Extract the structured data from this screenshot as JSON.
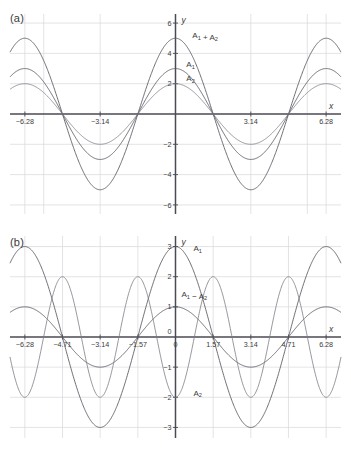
{
  "figure": {
    "panels": [
      {
        "id": "a",
        "label": "(a)",
        "axis": {
          "xlabel": "x",
          "ylabel": "y",
          "xticks": [
            "-6.28",
            "-3.14",
            "3.14",
            "6.28"
          ],
          "xtick_values": [
            -6.28,
            -3.14,
            3.14,
            6.28
          ],
          "yticks": [
            "6",
            "4",
            "2",
            "-2",
            "-4",
            "-6"
          ],
          "ytick_values": [
            6,
            4,
            2,
            -2,
            -4,
            -6
          ],
          "xlim": [
            -6.9,
            6.9
          ],
          "ylim": [
            -6.6,
            6.6
          ]
        },
        "curve_labels": [
          {
            "text": "A",
            "sub": "1",
            "text2": " + A",
            "sub2": "2"
          },
          {
            "text": "A",
            "sub": "1"
          },
          {
            "text": "A",
            "sub": "2"
          }
        ]
      },
      {
        "id": "b",
        "label": "(b)",
        "axis": {
          "xlabel": "x",
          "ylabel": "y",
          "xticks": [
            "-6.28",
            "-4.71",
            "-3.14",
            "-1.57",
            "0",
            "1.57",
            "3.14",
            "4.71",
            "6.28"
          ],
          "xtick_values": [
            -6.28,
            -4.71,
            -3.14,
            -1.57,
            0,
            1.57,
            3.14,
            4.71,
            6.28
          ],
          "yticks": [
            "3",
            "2",
            "1",
            "0",
            "-1",
            "-2",
            "-3"
          ],
          "ytick_values": [
            3,
            2,
            1,
            0,
            -1,
            -2,
            -3
          ],
          "xlim": [
            -6.9,
            6.9
          ],
          "ylim": [
            -3.35,
            3.35
          ]
        },
        "curve_labels": [
          {
            "text": "A",
            "sub": "1"
          },
          {
            "text": "A",
            "sub": "1",
            "text2": " − A",
            "sub2": "2"
          },
          {
            "text": "A",
            "sub": "2"
          }
        ]
      }
    ]
  },
  "chart_data": [
    {
      "type": "line",
      "panel": "(a)",
      "title": "",
      "xlabel": "x",
      "ylabel": "y",
      "xlim": [
        -6.9,
        6.9
      ],
      "ylim": [
        -6.6,
        6.6
      ],
      "xticks": [
        -6.28,
        -3.14,
        3.14,
        6.28
      ],
      "yticks": [
        6,
        4,
        2,
        -2,
        -4,
        -6
      ],
      "grid": true,
      "legend": "inline-labels",
      "series": [
        {
          "name": "A1 + A2",
          "label": "A₁ + A₂",
          "formula": "3*cos(x) + 2*cos(x)",
          "amplitude": 5,
          "period": 6.283,
          "max": 5,
          "min": -5,
          "value_at_0": 5,
          "color": "#55555e",
          "label_x": 0.7,
          "label_y": 5.0
        },
        {
          "name": "A1",
          "label": "A₁",
          "formula": "3*cos(x)",
          "amplitude": 3,
          "period": 6.283,
          "max": 3,
          "min": -3,
          "value_at_0": 3,
          "color": "#55555e",
          "label_x": 0.45,
          "label_y": 3.1
        },
        {
          "name": "A2",
          "label": "A₂",
          "formula": "2*cos(x)",
          "amplitude": 2,
          "period": 6.283,
          "max": 2,
          "min": -2,
          "value_at_0": 2,
          "color": "#7b7b85",
          "label_x": 0.45,
          "label_y": 2.15
        }
      ]
    },
    {
      "type": "line",
      "panel": "(b)",
      "title": "",
      "xlabel": "x",
      "ylabel": "y",
      "xlim": [
        -6.9,
        6.9
      ],
      "ylim": [
        -3.35,
        3.35
      ],
      "xticks": [
        -6.28,
        -4.71,
        -3.14,
        -1.57,
        0,
        1.57,
        3.14,
        4.71,
        6.28
      ],
      "yticks": [
        3,
        2,
        1,
        0,
        -1,
        -2,
        -3
      ],
      "grid": true,
      "legend": "inline-labels",
      "series": [
        {
          "name": "A1",
          "label": "A₁",
          "formula": "3*cos(x)",
          "amplitude": 3,
          "period": 6.283,
          "max": 3,
          "min": -3,
          "value_at_0": 3,
          "color": "#55555e",
          "label_x": 0.75,
          "label_y": 2.85
        },
        {
          "name": "A1 - A2",
          "label": "A₁ − A₂",
          "formula": "cos(x)*2 - cos(x)",
          "amplitude": 1,
          "period": 6.283,
          "max": 1,
          "min": -1,
          "value_at_0": 1,
          "color": "#55555e",
          "label_x": 0.25,
          "label_y": 1.32
        },
        {
          "name": "A2",
          "label": "A₂",
          "formula": "-2*cos(2x)",
          "amplitude": 2,
          "period": 3.142,
          "max": 2,
          "min": -2,
          "value_at_0": -2,
          "color": "#7b7b85",
          "label_x": 0.75,
          "label_y": -1.95
        }
      ]
    }
  ]
}
